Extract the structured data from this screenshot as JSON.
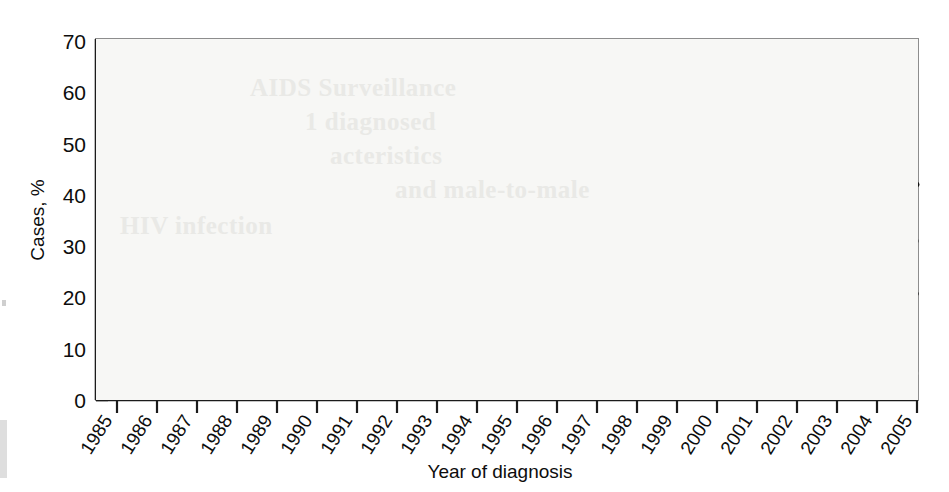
{
  "chart_data": {
    "type": "line",
    "title": "",
    "xlabel": "Year of diagnosis",
    "ylabel": "Cases, %",
    "xlim": [
      1985,
      2005
    ],
    "ylim": [
      0,
      70
    ],
    "yticks": [
      0,
      10,
      20,
      30,
      40,
      50,
      60,
      70
    ],
    "grid": false,
    "legend_position": "inline-annotations",
    "categories": [
      1985,
      1986,
      1987,
      1988,
      1989,
      1990,
      1991,
      1992,
      1993,
      1994,
      1995,
      1996,
      1997,
      1998,
      1999,
      2000,
      2001,
      2002,
      2003,
      2004,
      2005
    ],
    "series": [
      {
        "name": "Male-to-male sexual contact",
        "color": "#111111",
        "style": "solid-thick",
        "values": [
          63.5,
          63.0,
          61.0,
          57.8,
          57.0,
          55.5,
          53.5,
          51.0,
          47.0,
          46.2,
          45.0,
          43.5,
          41.2,
          40.2,
          40.4,
          39.2,
          40.2,
          40.8,
          41.6,
          41.8,
          42.0
        ]
      },
      {
        "name": "Injection drug use (IDU)",
        "color": "#3c3c3c",
        "style": "solid-medium",
        "values": [
          18.3,
          18.2,
          19.6,
          22.3,
          24.0,
          25.5,
          26.5,
          27.4,
          30.5,
          29.8,
          29.6,
          28.3,
          26.8,
          25.8,
          24.6,
          23.5,
          22.8,
          22.0,
          21.2,
          20.6,
          20.7
        ]
      },
      {
        "name": "High-risk heterosexual contact*",
        "color": "#5a5a5a",
        "style": "dotted-medium",
        "values": [
          2.6,
          2.4,
          3.0,
          3.6,
          4.4,
          5.6,
          7.6,
          9.8,
          12.6,
          15.4,
          18.6,
          21.2,
          23.2,
          25.0,
          26.4,
          27.6,
          29.0,
          30.0,
          30.9,
          30.9,
          31.0
        ]
      },
      {
        "name": "Male-to-male sexual contact and IDU",
        "color": "#9a9a9a",
        "style": "solid-light",
        "values": [
          8.6,
          8.6,
          8.5,
          8.2,
          7.6,
          7.3,
          7.2,
          7.2,
          7.1,
          7.1,
          7.1,
          7.1,
          6.6,
          5.9,
          5.8,
          5.8,
          5.7,
          5.5,
          5.3,
          5.2,
          5.2
        ]
      }
    ],
    "annotations": [
      {
        "name": "msm-label",
        "text": "Male-to-male sexual contact",
        "x": 612,
        "y": 166
      },
      {
        "name": "idu-label",
        "text": "Injection drug use (IDU)",
        "x": 130,
        "y": 247
      },
      {
        "name": "hetero-label",
        "text": "High-risk heterosexual contact*",
        "x": 168,
        "y": 318
      },
      {
        "name": "msm-idu-label",
        "text": "Male-to-male sexual contact and IDU",
        "x": 530,
        "y": 325
      }
    ],
    "leader_lines": [
      {
        "name": "idu-leader",
        "x1": 257,
        "y1": 254,
        "x2": 277,
        "y2": 275
      },
      {
        "name": "hetero-leader",
        "x1": 443,
        "y1": 325,
        "x2": 460,
        "y2": 346
      },
      {
        "name": "msm-idu-leader",
        "x1": 672,
        "y1": 332,
        "x2": 655,
        "y2": 356
      }
    ]
  },
  "ghost_text": {
    "line1": "AIDS Surveillance",
    "line2": "1 diagnosed",
    "line3": "acteristics",
    "line4": "and male-to-male",
    "line5": "HIV infection"
  }
}
